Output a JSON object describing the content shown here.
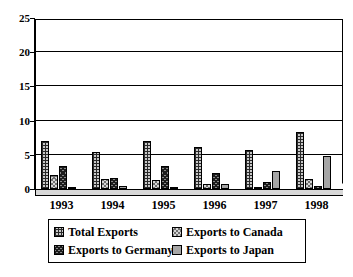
{
  "chart_data": {
    "type": "bar",
    "title": "",
    "subtitle": "",
    "xlabel": "",
    "ylabel": "",
    "ylim": [
      0,
      25
    ],
    "yticks": [
      0,
      5,
      10,
      15,
      20,
      25
    ],
    "ytick_labels": [
      "0",
      "5",
      "10",
      "15",
      "20",
      "25"
    ],
    "grid": true,
    "grid_axis": "y",
    "legend_position": "bottom",
    "categories": [
      "1993",
      "1994",
      "1995",
      "1996",
      "1997",
      "1998"
    ],
    "series": [
      {
        "name": "Total Exports",
        "pattern": "cross-hatch-grid",
        "color": "#c9c9c9",
        "values": [
          7.0,
          5.4,
          7.0,
          6.2,
          5.7,
          8.3
        ]
      },
      {
        "name": "Exports to Canada",
        "pattern": "light-diagonal-cross",
        "color": "#d6d6d6",
        "values": [
          2.0,
          1.4,
          1.3,
          0.8,
          0.3,
          1.5
        ]
      },
      {
        "name": "Exports to Germany",
        "pattern": "dark-diagonal-cross",
        "color": "#888888",
        "values": [
          3.3,
          1.6,
          3.3,
          2.4,
          1.0,
          0.5
        ]
      },
      {
        "name": "Exports to Japan",
        "pattern": "solid-gray",
        "color": "#a6a6a6",
        "values": [
          0.3,
          0.5,
          0.3,
          0.7,
          2.7,
          4.8
        ]
      }
    ]
  },
  "legend": {
    "entries": [
      {
        "label": "Total Exports"
      },
      {
        "label": "Exports to Canada"
      },
      {
        "label": "Exports to Germany"
      },
      {
        "label": "Exports to Japan"
      }
    ]
  }
}
